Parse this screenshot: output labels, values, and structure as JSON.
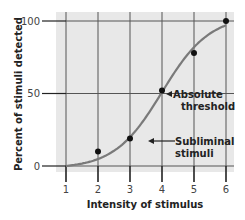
{
  "chart_data": {
    "type": "line",
    "title": "",
    "xlabel": "Intensity of stimulus",
    "ylabel": "Percent of stimuli detected",
    "x": [
      1,
      2,
      3,
      4,
      5,
      6
    ],
    "x_ticks": [
      "1",
      "2",
      "3",
      "4",
      "5",
      "6"
    ],
    "y_ticks": [
      "0",
      "50",
      "100"
    ],
    "xlim": [
      1,
      6
    ],
    "ylim": [
      0,
      100
    ],
    "grid": true,
    "series": [
      {
        "name": "Observed detection",
        "kind": "scatter",
        "x": [
          2,
          3,
          4,
          5,
          6
        ],
        "values": [
          10,
          19,
          52,
          78,
          100
        ]
      },
      {
        "name": "Fitted curve",
        "kind": "smooth-line",
        "x": [
          1,
          2,
          3,
          4,
          5,
          6
        ],
        "values": [
          0,
          6,
          22,
          50,
          80,
          96
        ]
      }
    ],
    "annotations": [
      {
        "text_lines": [
          "Absolute",
          "threshold"
        ],
        "points_to": {
          "x": 4,
          "y": 50
        }
      },
      {
        "text_lines": [
          "Subliminal",
          "stimuli"
        ],
        "points_to": {
          "x": 3.6,
          "y": 20
        }
      }
    ],
    "colors": {
      "panel_bg": "#e8e8e8",
      "grid": "#555555",
      "curve": "#7a7a7a",
      "points": "#111111"
    }
  }
}
